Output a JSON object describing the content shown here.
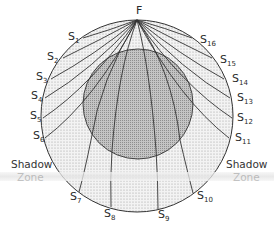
{
  "diagram": {
    "type": "seismic-ray-shadow-zone",
    "focus_label": "F",
    "rays": [
      {
        "id": "S1",
        "letter": "S",
        "sub": "1"
      },
      {
        "id": "S2",
        "letter": "S",
        "sub": "2"
      },
      {
        "id": "S3",
        "letter": "S",
        "sub": "3"
      },
      {
        "id": "S4",
        "letter": "S",
        "sub": "4"
      },
      {
        "id": "S5",
        "letter": "S",
        "sub": "5"
      },
      {
        "id": "S6",
        "letter": "S",
        "sub": "6"
      },
      {
        "id": "S7",
        "letter": "S",
        "sub": "7"
      },
      {
        "id": "S8",
        "letter": "S",
        "sub": "8"
      },
      {
        "id": "S9",
        "letter": "S",
        "sub": "9"
      },
      {
        "id": "S10",
        "letter": "S",
        "sub": "10"
      },
      {
        "id": "S11",
        "letter": "S",
        "sub": "11"
      },
      {
        "id": "S12",
        "letter": "S",
        "sub": "12"
      },
      {
        "id": "S13",
        "letter": "S",
        "sub": "13"
      },
      {
        "id": "S14",
        "letter": "S",
        "sub": "14"
      },
      {
        "id": "S15",
        "letter": "S",
        "sub": "15"
      },
      {
        "id": "S16",
        "letter": "S",
        "sub": "16"
      }
    ],
    "left_zone": {
      "line1": "Shadow",
      "line2": "Zone"
    },
    "right_zone": {
      "line1": "Shadow",
      "line2": "Zone"
    },
    "colors": {
      "mantle_fill": "#eeeeee",
      "core_fill": "#b8b8b8",
      "stroke": "#333333"
    }
  }
}
